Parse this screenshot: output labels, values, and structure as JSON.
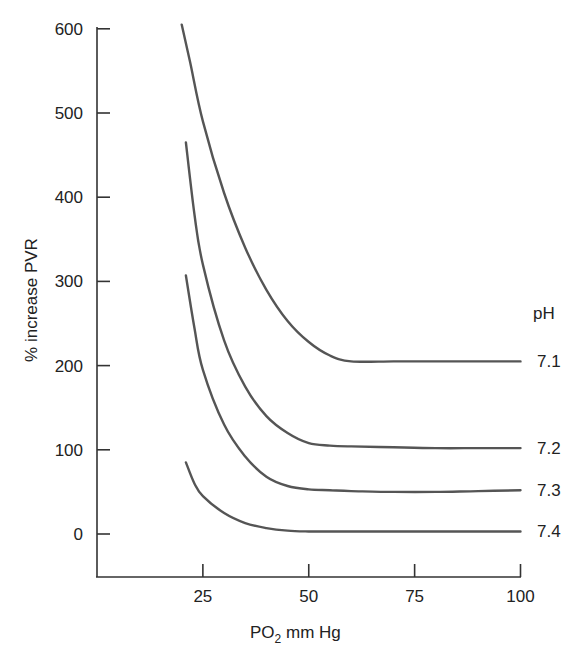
{
  "chart_data": {
    "type": "line",
    "title": "",
    "xlabel": "PO2 mm Hg",
    "xlabel_main": "PO",
    "xlabel_sub": "2",
    "xlabel_rest": " mm Hg",
    "ylabel": "% increase PVR",
    "xlim": [
      0,
      100
    ],
    "ylim": [
      -50,
      600
    ],
    "x_ticks": [
      25,
      50,
      75,
      100
    ],
    "x_tick_labels": [
      "25",
      "50",
      "75",
      "100"
    ],
    "y_ticks": [
      0,
      100,
      200,
      300,
      400,
      500,
      600
    ],
    "y_tick_labels": [
      "0",
      "100",
      "200",
      "300",
      "400",
      "500",
      "600"
    ],
    "grid": false,
    "legend_title": "pH",
    "legend_position": "right, inline at curve ends",
    "series": [
      {
        "name": "7.1",
        "x": [
          20,
          22,
          25,
          30,
          35,
          40,
          45,
          50,
          55,
          60,
          70,
          80,
          90,
          100
        ],
        "values": [
          605,
          560,
          490,
          405,
          340,
          290,
          253,
          228,
          212,
          205,
          205,
          205,
          205,
          205
        ]
      },
      {
        "name": "7.2",
        "x": [
          21,
          23,
          25,
          30,
          35,
          40,
          45,
          50,
          55,
          60,
          70,
          80,
          90,
          100
        ],
        "values": [
          465,
          380,
          320,
          230,
          175,
          140,
          120,
          108,
          105,
          104,
          103,
          102,
          102,
          102
        ]
      },
      {
        "name": "7.3",
        "x": [
          21,
          23,
          25,
          30,
          35,
          40,
          45,
          50,
          55,
          60,
          70,
          80,
          90,
          100
        ],
        "values": [
          307,
          245,
          195,
          130,
          92,
          68,
          57,
          53,
          52,
          51,
          50,
          50,
          51,
          52
        ]
      },
      {
        "name": "7.4",
        "x": [
          21,
          23,
          25,
          30,
          35,
          40,
          45,
          50,
          55,
          60,
          70,
          80,
          90,
          100
        ],
        "values": [
          85,
          60,
          45,
          25,
          13,
          7,
          4,
          3,
          3,
          3,
          3,
          3,
          3,
          3
        ]
      }
    ]
  }
}
